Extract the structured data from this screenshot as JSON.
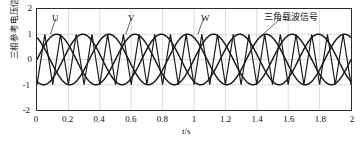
{
  "chart_data": {
    "type": "line",
    "title": "",
    "xlabel": "t/s",
    "ylabel": "三相参考电压信号/V",
    "xlim": [
      0,
      2
    ],
    "ylim": [
      -2,
      2
    ],
    "grid": true,
    "xticks": [
      "0",
      "0.2",
      "0.4",
      "0.6",
      "0.8",
      "1",
      "1.2",
      "1.4",
      "1.6",
      "1.8",
      "2"
    ],
    "xtick_values": [
      0,
      0.2,
      0.4,
      0.6,
      0.8,
      1,
      1.2,
      1.4,
      1.6,
      1.8,
      2
    ],
    "yticks": [
      "-2",
      "-1",
      "0",
      "1",
      "2"
    ],
    "ytick_values": [
      -2,
      -1,
      0,
      1,
      2
    ],
    "legend_position": "inline-annotations",
    "series": [
      {
        "name": "U",
        "kind": "sine",
        "amplitude": 1,
        "period": 0.5,
        "phase_deg": 0,
        "color": "#1a1a1a"
      },
      {
        "name": "V",
        "kind": "sine",
        "amplitude": 1,
        "period": 0.5,
        "phase_deg": -120,
        "color": "#1a1a1a"
      },
      {
        "name": "W",
        "kind": "sine",
        "amplitude": 1,
        "period": 0.5,
        "phase_deg": -240,
        "color": "#1a1a1a"
      },
      {
        "name": "三角载波信号",
        "kind": "triangle",
        "amplitude": 1,
        "period": 0.1,
        "phase_deg": 0,
        "color": "#1a1a1a"
      }
    ],
    "annotations": [
      {
        "text": "U",
        "x": 0.12,
        "y": 1.62,
        "leader_to_x": 0.085,
        "leader_to_y": 1.0
      },
      {
        "text": "V",
        "x": 0.6,
        "y": 1.62,
        "leader_to_x": 0.565,
        "leader_to_y": 1.0
      },
      {
        "text": "W",
        "x": 1.06,
        "y": 1.62,
        "leader_to_x": 1.025,
        "leader_to_y": 1.0
      },
      {
        "text": "三角载波信号",
        "x": 1.55,
        "y": 1.62,
        "leader_to_x": 1.44,
        "leader_to_y": 1.0
      }
    ]
  },
  "axis": {
    "y_title": "三相参考电压信号/V",
    "x_unit": "t/s",
    "x_unit_var": "t",
    "x_unit_den": "/s"
  },
  "annotations": {
    "u": "U",
    "v": "V",
    "w": "W",
    "carrier": "三角载波信号"
  },
  "colors": {
    "trace": "#1a1a1a",
    "frame": "#2a2a2a",
    "grid": "#c9c9c9",
    "background": "#ffffff"
  }
}
